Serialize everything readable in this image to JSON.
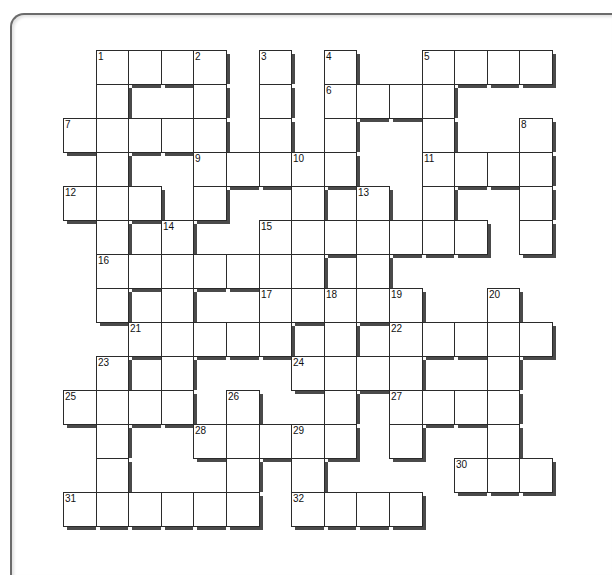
{
  "puzzle": {
    "type": "crossword",
    "rows": 14,
    "cols": 15,
    "colors": {
      "cell_border": "#2b2b2b",
      "shadow": "#4a4a4a",
      "cell_fill": "#ffffff",
      "frame": "#6b6b6b"
    },
    "cells": [
      {
        "r": 0,
        "c": 1,
        "n": "1"
      },
      {
        "r": 0,
        "c": 2
      },
      {
        "r": 0,
        "c": 3
      },
      {
        "r": 0,
        "c": 4,
        "n": "2"
      },
      {
        "r": 0,
        "c": 6,
        "n": "3"
      },
      {
        "r": 0,
        "c": 8,
        "n": "4"
      },
      {
        "r": 0,
        "c": 11,
        "n": "5"
      },
      {
        "r": 0,
        "c": 12
      },
      {
        "r": 0,
        "c": 13
      },
      {
        "r": 0,
        "c": 14
      },
      {
        "r": 1,
        "c": 1
      },
      {
        "r": 1,
        "c": 4
      },
      {
        "r": 1,
        "c": 6
      },
      {
        "r": 1,
        "c": 8,
        "n": "6"
      },
      {
        "r": 1,
        "c": 9
      },
      {
        "r": 1,
        "c": 10
      },
      {
        "r": 1,
        "c": 11
      },
      {
        "r": 2,
        "c": 0,
        "n": "7"
      },
      {
        "r": 2,
        "c": 1
      },
      {
        "r": 2,
        "c": 2
      },
      {
        "r": 2,
        "c": 3
      },
      {
        "r": 2,
        "c": 4
      },
      {
        "r": 2,
        "c": 6
      },
      {
        "r": 2,
        "c": 8
      },
      {
        "r": 2,
        "c": 11
      },
      {
        "r": 2,
        "c": 14,
        "n": "8"
      },
      {
        "r": 3,
        "c": 1
      },
      {
        "r": 3,
        "c": 4,
        "n": "9"
      },
      {
        "r": 3,
        "c": 5
      },
      {
        "r": 3,
        "c": 6
      },
      {
        "r": 3,
        "c": 7,
        "n": "10"
      },
      {
        "r": 3,
        "c": 8
      },
      {
        "r": 3,
        "c": 11,
        "n": "11"
      },
      {
        "r": 3,
        "c": 12
      },
      {
        "r": 3,
        "c": 13
      },
      {
        "r": 3,
        "c": 14
      },
      {
        "r": 4,
        "c": 0,
        "n": "12"
      },
      {
        "r": 4,
        "c": 1
      },
      {
        "r": 4,
        "c": 2
      },
      {
        "r": 4,
        "c": 4
      },
      {
        "r": 4,
        "c": 7
      },
      {
        "r": 4,
        "c": 9,
        "n": "13"
      },
      {
        "r": 4,
        "c": 11
      },
      {
        "r": 4,
        "c": 14
      },
      {
        "r": 5,
        "c": 1
      },
      {
        "r": 5,
        "c": 3,
        "n": "14"
      },
      {
        "r": 5,
        "c": 6,
        "n": "15"
      },
      {
        "r": 5,
        "c": 7
      },
      {
        "r": 5,
        "c": 8
      },
      {
        "r": 5,
        "c": 9
      },
      {
        "r": 5,
        "c": 10
      },
      {
        "r": 5,
        "c": 11
      },
      {
        "r": 5,
        "c": 12
      },
      {
        "r": 5,
        "c": 14
      },
      {
        "r": 6,
        "c": 1,
        "n": "16"
      },
      {
        "r": 6,
        "c": 2
      },
      {
        "r": 6,
        "c": 3
      },
      {
        "r": 6,
        "c": 4
      },
      {
        "r": 6,
        "c": 5
      },
      {
        "r": 6,
        "c": 6
      },
      {
        "r": 6,
        "c": 7
      },
      {
        "r": 6,
        "c": 9
      },
      {
        "r": 7,
        "c": 1
      },
      {
        "r": 7,
        "c": 3
      },
      {
        "r": 7,
        "c": 6,
        "n": "17"
      },
      {
        "r": 7,
        "c": 7
      },
      {
        "r": 7,
        "c": 8,
        "n": "18"
      },
      {
        "r": 7,
        "c": 9
      },
      {
        "r": 7,
        "c": 10,
        "n": "19"
      },
      {
        "r": 7,
        "c": 13,
        "n": "20"
      },
      {
        "r": 8,
        "c": 2,
        "n": "21"
      },
      {
        "r": 8,
        "c": 3
      },
      {
        "r": 8,
        "c": 4
      },
      {
        "r": 8,
        "c": 5
      },
      {
        "r": 8,
        "c": 6
      },
      {
        "r": 8,
        "c": 8
      },
      {
        "r": 8,
        "c": 10,
        "n": "22"
      },
      {
        "r": 8,
        "c": 11
      },
      {
        "r": 8,
        "c": 12
      },
      {
        "r": 8,
        "c": 13
      },
      {
        "r": 8,
        "c": 14
      },
      {
        "r": 9,
        "c": 1,
        "n": "23"
      },
      {
        "r": 9,
        "c": 3
      },
      {
        "r": 9,
        "c": 7,
        "n": "24"
      },
      {
        "r": 9,
        "c": 8
      },
      {
        "r": 9,
        "c": 9
      },
      {
        "r": 9,
        "c": 10
      },
      {
        "r": 9,
        "c": 13
      },
      {
        "r": 10,
        "c": 0,
        "n": "25"
      },
      {
        "r": 10,
        "c": 1
      },
      {
        "r": 10,
        "c": 2
      },
      {
        "r": 10,
        "c": 3
      },
      {
        "r": 10,
        "c": 5,
        "n": "26"
      },
      {
        "r": 10,
        "c": 8
      },
      {
        "r": 10,
        "c": 10,
        "n": "27"
      },
      {
        "r": 10,
        "c": 11
      },
      {
        "r": 10,
        "c": 12
      },
      {
        "r": 10,
        "c": 13
      },
      {
        "r": 11,
        "c": 1
      },
      {
        "r": 11,
        "c": 4,
        "n": "28"
      },
      {
        "r": 11,
        "c": 5
      },
      {
        "r": 11,
        "c": 6
      },
      {
        "r": 11,
        "c": 7,
        "n": "29"
      },
      {
        "r": 11,
        "c": 8
      },
      {
        "r": 11,
        "c": 10
      },
      {
        "r": 11,
        "c": 13
      },
      {
        "r": 12,
        "c": 1
      },
      {
        "r": 12,
        "c": 5
      },
      {
        "r": 12,
        "c": 7
      },
      {
        "r": 12,
        "c": 12,
        "n": "30"
      },
      {
        "r": 12,
        "c": 13
      },
      {
        "r": 12,
        "c": 14
      },
      {
        "r": 13,
        "c": 0,
        "n": "31"
      },
      {
        "r": 13,
        "c": 1
      },
      {
        "r": 13,
        "c": 2
      },
      {
        "r": 13,
        "c": 3
      },
      {
        "r": 13,
        "c": 4
      },
      {
        "r": 13,
        "c": 5
      },
      {
        "r": 13,
        "c": 7,
        "n": "32"
      },
      {
        "r": 13,
        "c": 8
      },
      {
        "r": 13,
        "c": 9
      },
      {
        "r": 13,
        "c": 10
      }
    ]
  }
}
